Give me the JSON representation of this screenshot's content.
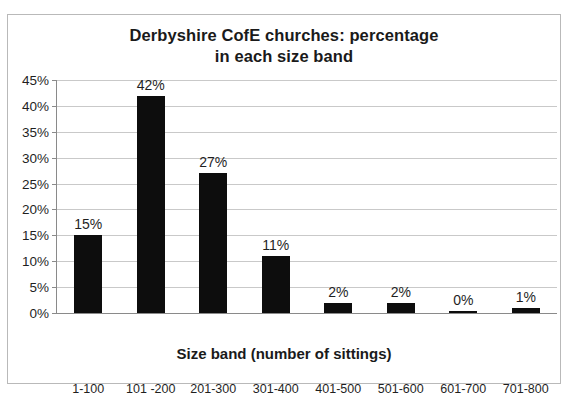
{
  "chart_data": {
    "type": "bar",
    "title": "Derbyshire CofE churches: percentage in each size band",
    "title_lines": [
      "Derbyshire CofE churches: percentage",
      "in each size band"
    ],
    "xlabel": "Size band (number of sittings)",
    "ylabel": "",
    "categories": [
      "1-100",
      "101 -200",
      "201-300",
      "301-400",
      "401-500",
      "501-600",
      "601-700",
      "701-800"
    ],
    "values": [
      15,
      42,
      27,
      11,
      2,
      2,
      0,
      1
    ],
    "data_labels": [
      "15%",
      "42%",
      "27%",
      "11%",
      "2%",
      "2%",
      "0%",
      "1%"
    ],
    "ylim": [
      0,
      45
    ],
    "ytick_values": [
      0,
      5,
      10,
      15,
      20,
      25,
      30,
      35,
      40,
      45
    ],
    "ytick_labels": [
      "0%",
      "5%",
      "10%",
      "15%",
      "20%",
      "25%",
      "30%",
      "35%",
      "40%",
      "45%"
    ],
    "grid": true,
    "legend": false,
    "series_color": "#0d0d0d",
    "grid_color": "#c9c9c9",
    "axis_color": "#8a8a8a",
    "unit": "%"
  }
}
